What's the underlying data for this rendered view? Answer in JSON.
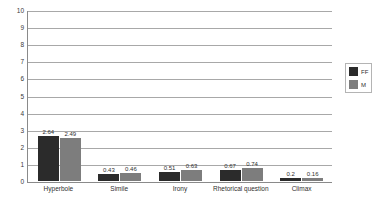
{
  "chart_data": {
    "type": "bar",
    "title": "",
    "xlabel": "",
    "ylabel": "",
    "ylim": [
      0,
      10
    ],
    "yticks": [
      0,
      1,
      2,
      3,
      4,
      5,
      6,
      7,
      8,
      9,
      10
    ],
    "grid": true,
    "legend_position": "right",
    "categories": [
      "Hyperbole",
      "Simile",
      "Irony",
      "Rhetorical question",
      "Climax"
    ],
    "series": [
      {
        "name": "FF",
        "color": "#2b2b2b",
        "values": [
          2.64,
          0.43,
          0.51,
          0.67,
          0.2
        ]
      },
      {
        "name": "M",
        "color": "#7d7d7d",
        "values": [
          2.49,
          0.46,
          0.63,
          0.74,
          0.16
        ]
      }
    ],
    "value_labels": {
      "Hyperbole": [
        "2.64",
        "2.49"
      ],
      "Simile": [
        "0.43",
        "0.46"
      ],
      "Irony": [
        "0.51",
        "0.63"
      ],
      "Rhetorical question": [
        "0.67",
        "0.74"
      ],
      "Climax": [
        "0.2",
        "0.16"
      ]
    }
  },
  "axis": {
    "y_tick_labels": [
      "10",
      "9",
      "8",
      "7",
      "6",
      "5",
      "4",
      "3",
      "2",
      "1",
      "0"
    ]
  },
  "legend": {
    "items": [
      {
        "label": "FF",
        "color": "#2b2b2b"
      },
      {
        "label": "M",
        "color": "#7d7d7d"
      }
    ]
  }
}
